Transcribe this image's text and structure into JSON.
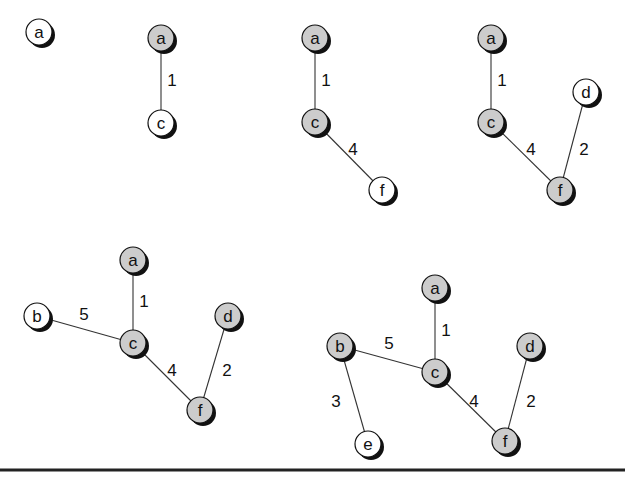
{
  "colors": {
    "in_tree": "#cccccc",
    "frontier": "#ffffff",
    "shadow": "#111111",
    "edge": "#333333",
    "text": "#111111"
  },
  "node_radius": 13,
  "graphs": [
    {
      "id": "step-1",
      "nodes": [
        {
          "id": "a",
          "label": "a",
          "x": 39,
          "y": 32,
          "state": "frontier"
        }
      ],
      "edges": []
    },
    {
      "id": "step-2",
      "nodes": [
        {
          "id": "a",
          "label": "a",
          "x": 161,
          "y": 38,
          "state": "in_tree"
        },
        {
          "id": "c",
          "label": "c",
          "x": 161,
          "y": 123,
          "state": "frontier"
        }
      ],
      "edges": [
        {
          "from": "a",
          "to": "c",
          "weight": "1",
          "lx": 172,
          "ly": 86
        }
      ]
    },
    {
      "id": "step-3",
      "nodes": [
        {
          "id": "a",
          "label": "a",
          "x": 315,
          "y": 38,
          "state": "in_tree"
        },
        {
          "id": "c",
          "label": "c",
          "x": 315,
          "y": 122,
          "state": "in_tree"
        },
        {
          "id": "f",
          "label": "f",
          "x": 382,
          "y": 190,
          "state": "frontier"
        }
      ],
      "edges": [
        {
          "from": "a",
          "to": "c",
          "weight": "1",
          "lx": 326,
          "ly": 86
        },
        {
          "from": "c",
          "to": "f",
          "weight": "4",
          "lx": 353,
          "ly": 155
        }
      ]
    },
    {
      "id": "step-4",
      "nodes": [
        {
          "id": "a",
          "label": "a",
          "x": 491,
          "y": 38,
          "state": "in_tree"
        },
        {
          "id": "c",
          "label": "c",
          "x": 491,
          "y": 122,
          "state": "in_tree"
        },
        {
          "id": "d",
          "label": "d",
          "x": 586,
          "y": 92,
          "state": "frontier"
        },
        {
          "id": "f",
          "label": "f",
          "x": 560,
          "y": 190,
          "state": "in_tree"
        }
      ],
      "edges": [
        {
          "from": "a",
          "to": "c",
          "weight": "1",
          "lx": 502,
          "ly": 86
        },
        {
          "from": "c",
          "to": "f",
          "weight": "4",
          "lx": 531,
          "ly": 155
        },
        {
          "from": "d",
          "to": "f",
          "weight": "2",
          "lx": 584,
          "ly": 155
        }
      ]
    },
    {
      "id": "step-5",
      "nodes": [
        {
          "id": "a",
          "label": "a",
          "x": 133,
          "y": 260,
          "state": "in_tree"
        },
        {
          "id": "b",
          "label": "b",
          "x": 37,
          "y": 316,
          "state": "frontier"
        },
        {
          "id": "c",
          "label": "c",
          "x": 133,
          "y": 343,
          "state": "in_tree"
        },
        {
          "id": "d",
          "label": "d",
          "x": 228,
          "y": 316,
          "state": "in_tree"
        },
        {
          "id": "f",
          "label": "f",
          "x": 200,
          "y": 410,
          "state": "in_tree"
        }
      ],
      "edges": [
        {
          "from": "a",
          "to": "c",
          "weight": "1",
          "lx": 144,
          "ly": 307
        },
        {
          "from": "b",
          "to": "c",
          "weight": "5",
          "lx": 84,
          "ly": 320
        },
        {
          "from": "c",
          "to": "f",
          "weight": "4",
          "lx": 172,
          "ly": 376
        },
        {
          "from": "d",
          "to": "f",
          "weight": "2",
          "lx": 227,
          "ly": 376
        }
      ]
    },
    {
      "id": "step-6",
      "nodes": [
        {
          "id": "a",
          "label": "a",
          "x": 435,
          "y": 288,
          "state": "in_tree"
        },
        {
          "id": "b",
          "label": "b",
          "x": 340,
          "y": 346,
          "state": "in_tree"
        },
        {
          "id": "c",
          "label": "c",
          "x": 435,
          "y": 372,
          "state": "in_tree"
        },
        {
          "id": "d",
          "label": "d",
          "x": 530,
          "y": 346,
          "state": "in_tree"
        },
        {
          "id": "e",
          "label": "e",
          "x": 368,
          "y": 444,
          "state": "frontier"
        },
        {
          "id": "f",
          "label": "f",
          "x": 505,
          "y": 441,
          "state": "in_tree"
        }
      ],
      "edges": [
        {
          "from": "a",
          "to": "c",
          "weight": "1",
          "lx": 446,
          "ly": 336
        },
        {
          "from": "b",
          "to": "c",
          "weight": "5",
          "lx": 389,
          "ly": 349
        },
        {
          "from": "b",
          "to": "e",
          "weight": "3",
          "lx": 336,
          "ly": 407
        },
        {
          "from": "c",
          "to": "f",
          "weight": "4",
          "lx": 474,
          "ly": 407
        },
        {
          "from": "d",
          "to": "f",
          "weight": "2",
          "lx": 531,
          "ly": 407
        }
      ]
    }
  ]
}
